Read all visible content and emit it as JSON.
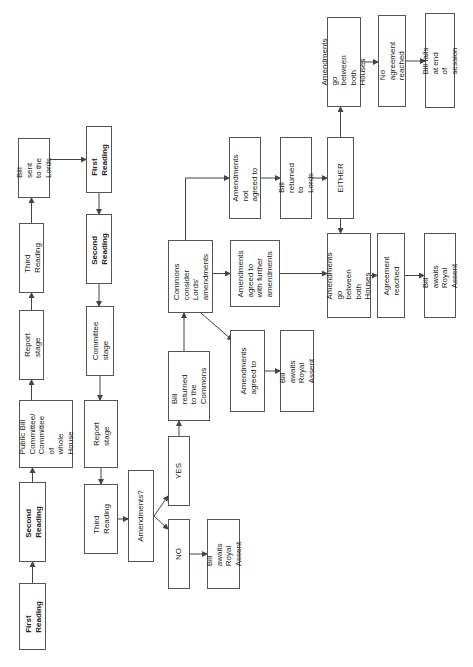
{
  "diagram": {
    "nodes": {
      "c_first_reading": "First Reading",
      "c_second_reading": "Second Reading",
      "c_committee": "Public Bill\nCommittee/\nCommittee of\nwhole House",
      "c_report": "Report stage",
      "c_third_reading": "Third Reading",
      "sent_to_lords": "Bill sent to the\nLords",
      "l_first_reading": "First Reading",
      "l_second_reading": "Second Reading",
      "l_committee": "Committee\nstage",
      "l_report": "Report stage",
      "l_third_reading": "Third Reading",
      "amendments_q": "Amendments?",
      "yes": "YES",
      "no": "NO",
      "no_royal_assent": "Bill awaits\nRoyal Assent",
      "returned_commons": "Bill returned\nto the\nCommons",
      "commons_consider": "Commons\nconsider Lords'\namendments",
      "agreed_to": "Amendments\nagreed to",
      "agreed_royal_assent": "Bill awaits Royal\nAssent",
      "further_amendments": "Amendments\nagreed to\nwith further\namendments",
      "not_agreed": "Amendments not\nagreed to",
      "returned_lords": "Bill returned to\nLords",
      "either": "EITHER",
      "ping_pong_top": "Amendments go\nbetween both\nHouses",
      "no_agreement": "No agreement\nreached",
      "bill_fails": "Bill fails at end of\nsession",
      "ping_pong_bottom": "Amendments go\nbetween both\nHouses",
      "agreement": "Agreement\nreached",
      "final_royal_assent": "Bill awaits Royal\nAssent"
    },
    "edges": [
      [
        "c_first_reading",
        "c_second_reading"
      ],
      [
        "c_second_reading",
        "c_committee"
      ],
      [
        "c_committee",
        "c_report"
      ],
      [
        "c_report",
        "c_third_reading"
      ],
      [
        "c_third_reading",
        "sent_to_lords"
      ],
      [
        "sent_to_lords",
        "l_first_reading"
      ],
      [
        "l_first_reading",
        "l_second_reading"
      ],
      [
        "l_second_reading",
        "l_committee"
      ],
      [
        "l_committee",
        "l_report"
      ],
      [
        "l_report",
        "l_third_reading"
      ],
      [
        "l_third_reading",
        "amendments_q"
      ],
      [
        "amendments_q",
        "yes"
      ],
      [
        "amendments_q",
        "no"
      ],
      [
        "no",
        "no_royal_assent"
      ],
      [
        "yes",
        "returned_commons"
      ],
      [
        "returned_commons",
        "commons_consider"
      ],
      [
        "commons_consider",
        "agreed_to"
      ],
      [
        "commons_consider",
        "further_amendments"
      ],
      [
        "commons_consider",
        "not_agreed"
      ],
      [
        "agreed_to",
        "agreed_royal_assent"
      ],
      [
        "further_amendments",
        "ping_pong_bottom"
      ],
      [
        "not_agreed",
        "returned_lords"
      ],
      [
        "returned_lords",
        "either"
      ],
      [
        "either",
        "ping_pong_top"
      ],
      [
        "either",
        "ping_pong_bottom"
      ],
      [
        "ping_pong_top",
        "no_agreement"
      ],
      [
        "no_agreement",
        "bill_fails"
      ],
      [
        "ping_pong_bottom",
        "agreement"
      ],
      [
        "agreement",
        "final_royal_assent"
      ]
    ],
    "colors": {
      "line": "#444444",
      "border": "#555555",
      "text": "#222222"
    }
  }
}
